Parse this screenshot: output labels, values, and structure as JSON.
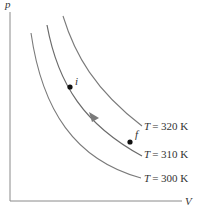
{
  "diagram": {
    "title": "",
    "axes": {
      "y_label": "p",
      "x_label": "V"
    },
    "isotherms": [
      {
        "label": "T = 320 K",
        "var": "T",
        "value": "= 320 K"
      },
      {
        "label": "T = 310 K",
        "var": "T",
        "value": "= 310 K"
      },
      {
        "label": "T = 300 K",
        "var": "T",
        "value": "= 300 K"
      }
    ],
    "points": [
      {
        "name": "i",
        "label": "i"
      },
      {
        "name": "f",
        "label": "f"
      }
    ],
    "colors": {
      "curve": "#7a7a7a",
      "axis": "#8a8a8a",
      "point": "#111111",
      "arrow": "#7a7a7a",
      "text": "#333333"
    }
  }
}
